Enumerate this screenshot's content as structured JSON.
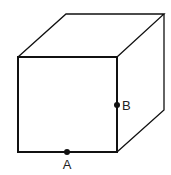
{
  "diagram": {
    "type": "cube",
    "colors": {
      "stroke": "#111111",
      "background": "#ffffff"
    },
    "points": [
      {
        "name": "A",
        "label": "A",
        "location": "midpoint of front bottom edge"
      },
      {
        "name": "B",
        "label": "B",
        "location": "midpoint of front right edge"
      }
    ]
  }
}
